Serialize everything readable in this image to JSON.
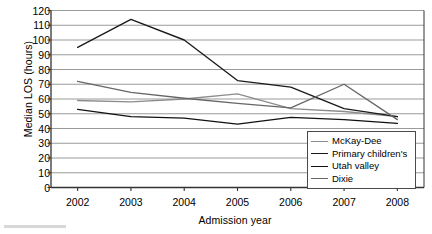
{
  "chart_data": {
    "type": "line",
    "title": "",
    "xlabel": "Admission year",
    "ylabel": "Median LOS (hours)",
    "categories": [
      "2002",
      "2003",
      "2004",
      "2005",
      "2006",
      "2007",
      "2008"
    ],
    "x": [
      2002,
      2003,
      2004,
      2005,
      2006,
      2007,
      2008
    ],
    "ylim": [
      0,
      120
    ],
    "yticks": [
      0,
      10,
      20,
      30,
      40,
      50,
      60,
      70,
      80,
      90,
      100,
      110,
      120
    ],
    "ytick_labels": [
      "0",
      "10",
      "20",
      "30",
      "40",
      "50",
      "60",
      "70",
      "80",
      "90",
      "100",
      "110",
      "120"
    ],
    "grid": "horizontal",
    "legend_position": "lower-right-inside",
    "series": [
      {
        "name": "McKay-Dee",
        "color": "#8c8c8c",
        "values": [
          59,
          58,
          60,
          63.5,
          53.5,
          51.5,
          48
        ]
      },
      {
        "name": "Primary children's",
        "color": "#1a1a1a",
        "values": [
          95,
          114,
          100,
          72.5,
          68,
          53.5,
          48
        ]
      },
      {
        "name": "Utah valley",
        "color": "#111111",
        "values": [
          53,
          48,
          47,
          43,
          47.5,
          46,
          43.5
        ]
      },
      {
        "name": "Dixie",
        "color": "#666666",
        "values": [
          72,
          64.5,
          60.5,
          57,
          54,
          70,
          46
        ]
      }
    ]
  },
  "legend": {
    "items": [
      {
        "label": "McKay-Dee"
      },
      {
        "label": "Primary children's"
      },
      {
        "label": "Utah valley"
      },
      {
        "label": "Dixie"
      }
    ]
  }
}
